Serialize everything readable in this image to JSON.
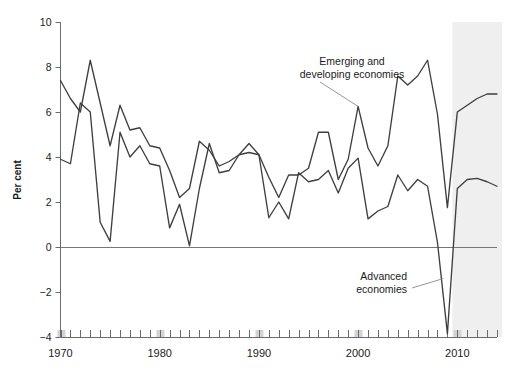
{
  "chart_data": {
    "type": "line",
    "title": "",
    "subtitle": "",
    "xlabel": "",
    "ylabel": "Per cent",
    "ylim": [
      -4,
      10
    ],
    "xlim": [
      1970,
      2014
    ],
    "ytick_values": [
      10,
      8,
      6,
      4,
      2,
      0,
      -2,
      -4
    ],
    "ytick_labels": [
      "10",
      "8",
      "6",
      "4",
      "2",
      "0",
      "-2",
      "-4"
    ],
    "xtick_values": [
      1970,
      1980,
      1990,
      2000,
      2010
    ],
    "xtick_labels": [
      "1970",
      "1980",
      "1990",
      "2000",
      "2010"
    ],
    "minor_tick_interval": 1,
    "grid": false,
    "legend_position": "inline-annotation",
    "zero_line": 0,
    "forecast_shading": {
      "label": "",
      "start_year": 2009.5,
      "end_year": 2014.5,
      "color": "#efefef"
    },
    "annotations": [
      {
        "name": "emerging-annotation",
        "text_lines": [
          "Emerging and",
          "developing economies"
        ],
        "series": "Emerging and developing economies",
        "anchor_year": 2000,
        "anchor_value": 6.25
      },
      {
        "name": "advanced-annotation",
        "text_lines": [
          "Advanced",
          "economies"
        ],
        "series": "Advanced economies",
        "anchor_year": 2008.6,
        "anchor_value": -1.4
      }
    ],
    "x": [
      1970,
      1971,
      1972,
      1973,
      1974,
      1975,
      1976,
      1977,
      1978,
      1979,
      1980,
      1981,
      1982,
      1983,
      1984,
      1985,
      1986,
      1987,
      1988,
      1989,
      1990,
      1991,
      1992,
      1993,
      1994,
      1995,
      1996,
      1997,
      1998,
      1999,
      2000,
      2001,
      2002,
      2003,
      2004,
      2005,
      2006,
      2007,
      2008,
      2009,
      2010,
      2011,
      2012,
      2013,
      2014
    ],
    "series": [
      {
        "name": "Emerging and developing economies",
        "color": "#3f3f3f",
        "values": [
          7.4,
          6.6,
          6.0,
          8.3,
          6.4,
          4.5,
          6.3,
          5.2,
          5.3,
          4.5,
          4.4,
          3.4,
          2.2,
          2.6,
          4.7,
          4.3,
          3.6,
          3.8,
          4.1,
          4.6,
          4.1,
          3.1,
          2.2,
          3.2,
          3.2,
          3.5,
          5.1,
          5.1,
          3.0,
          3.9,
          6.25,
          4.4,
          3.6,
          4.5,
          7.6,
          7.2,
          7.6,
          8.3,
          5.9,
          1.75,
          6.0,
          6.3,
          6.6,
          6.8,
          6.8
        ]
      },
      {
        "name": "Advanced economies",
        "color": "#3f3f3f",
        "values": [
          3.9,
          3.7,
          6.4,
          6.0,
          1.1,
          0.25,
          5.1,
          4.0,
          4.5,
          3.7,
          3.6,
          0.85,
          1.9,
          0.05,
          2.6,
          4.6,
          3.3,
          3.4,
          4.1,
          4.2,
          4.1,
          1.3,
          2.0,
          1.25,
          3.3,
          2.9,
          3.0,
          3.4,
          2.4,
          3.5,
          3.95,
          1.25,
          1.6,
          1.8,
          3.2,
          2.5,
          3.0,
          2.7,
          0.2,
          -3.85,
          2.6,
          3.0,
          3.05,
          2.9,
          2.7
        ]
      }
    ]
  },
  "axes": {
    "y_axis_label": "Per cent",
    "y_tick_labels": [
      "10",
      "8",
      "6",
      "4",
      "2",
      "0",
      "-2",
      "-4"
    ],
    "x_tick_labels": [
      "1970",
      "1980",
      "1990",
      "2000",
      "2010"
    ]
  },
  "annotations": {
    "emerging_line1": "Emerging and",
    "emerging_line2": "developing economies",
    "advanced_line1": "Advanced",
    "advanced_line2": "economies"
  },
  "colors": {
    "line": "#3f3f3f",
    "axis": "#6b6b6b",
    "zero_line": "#777777",
    "shade": "#efefef",
    "decade_tick_highlight": "#d3d3d3",
    "leader_line": "#8a8a8a",
    "text": "#1a1a1a",
    "background": "#ffffff"
  }
}
